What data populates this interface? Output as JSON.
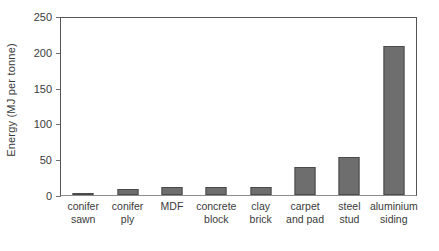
{
  "chart_data": {
    "type": "bar",
    "title": "",
    "xlabel": "",
    "ylabel": "Energy (MJ per tonne)",
    "ylim": [
      0,
      250
    ],
    "yticks": [
      0,
      50,
      100,
      150,
      200,
      250
    ],
    "grid": false,
    "legend": "none",
    "categories": [
      "conifer sawn",
      "conifer ply",
      "MDF",
      "concrete block",
      "clay brick",
      "carpet and pad",
      "steel stud",
      "aluminium siding"
    ],
    "category_lines": [
      {
        "l1": "conifer",
        "l2": "sawn"
      },
      {
        "l1": "conifer",
        "l2": "ply"
      },
      {
        "l1": "MDF",
        "l2": ""
      },
      {
        "l1": "concrete",
        "l2": "block"
      },
      {
        "l1": "clay",
        "l2": "brick"
      },
      {
        "l1": "carpet",
        "l2": "and pad"
      },
      {
        "l1": "steel",
        "l2": "stud"
      },
      {
        "l1": "aluminium",
        "l2": "siding"
      }
    ],
    "values": [
      1.5,
      8,
      11,
      11,
      11,
      40,
      53,
      210
    ],
    "bar_color": "#6e6e6e",
    "bar_edge_color": "#4a4a4a",
    "axis_color": "#555555"
  }
}
